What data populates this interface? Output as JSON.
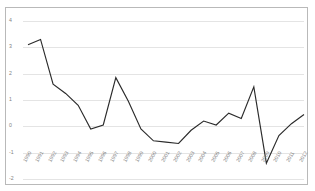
{
  "chart_data": {
    "type": "line",
    "title": "",
    "subtitle": "",
    "xlabel": "",
    "ylabel": "",
    "categories": [
      "1990",
      "1991",
      "1992",
      "1993",
      "1994",
      "1995",
      "1996",
      "1997",
      "1998",
      "1999",
      "2000",
      "2001",
      "2002",
      "2003",
      "2004",
      "2005",
      "2006",
      "2007",
      "2008",
      "2009",
      "2010",
      "2011",
      "2012"
    ],
    "values": [
      3.1,
      3.3,
      1.6,
      1.25,
      0.8,
      -0.1,
      0.05,
      1.85,
      0.95,
      -0.1,
      -0.55,
      -0.6,
      -0.65,
      -0.15,
      0.2,
      0.05,
      0.5,
      0.3,
      1.5,
      -1.4,
      -0.35,
      0.1,
      0.45
    ],
    "ylim": [
      -2,
      4
    ],
    "yticks": [
      "4",
      "3",
      "2",
      "1",
      "0",
      "-1",
      "-2"
    ],
    "ytick_values": [
      4,
      3,
      2,
      1,
      0,
      -1,
      -2
    ],
    "grid": true,
    "legend": "none",
    "series": [
      {
        "name": "series-1",
        "color": "#2b2b2b"
      }
    ]
  },
  "style": {
    "line_color": "#2b2b2b",
    "grid_color": "#e4e4e4",
    "frame_color": "#b9b9b9",
    "tick_label_color": "#828282",
    "background": "#ffffff"
  }
}
